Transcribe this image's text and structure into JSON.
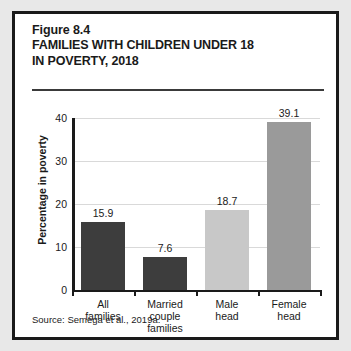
{
  "figure": {
    "number": "Figure 8.4",
    "title_line_1": "FAMILIES WITH CHILDREN UNDER 18",
    "title_line_2": "IN POVERTY, 2018",
    "source": "Source:  Semega et al., 2019a."
  },
  "chart_data": {
    "type": "bar",
    "title": "FAMILIES WITH CHILDREN UNDER 18 IN POVERTY, 2018",
    "categories": [
      "All families",
      "Married couple families",
      "Male head",
      "Female head"
    ],
    "category_lines": [
      [
        "All",
        "families"
      ],
      [
        "Married",
        "couple",
        "families"
      ],
      [
        "Male",
        "head"
      ],
      [
        "Female",
        "head"
      ]
    ],
    "values": [
      15.9,
      7.6,
      18.7,
      39.1
    ],
    "value_labels": [
      "15.9",
      "7.6",
      "18.7",
      "39.1"
    ],
    "bar_colors": [
      "#3d3d3d",
      "#3d3d3d",
      "#c8c8c8",
      "#9a9a9a"
    ],
    "xlabel": "",
    "ylabel": "Percentage in poverty",
    "ylim": [
      0,
      40
    ],
    "yticks": [
      0,
      10,
      20,
      30,
      40
    ],
    "ytick_labels": [
      "0",
      "10",
      "20",
      "30",
      "40"
    ],
    "grid": true,
    "legend": "none"
  }
}
